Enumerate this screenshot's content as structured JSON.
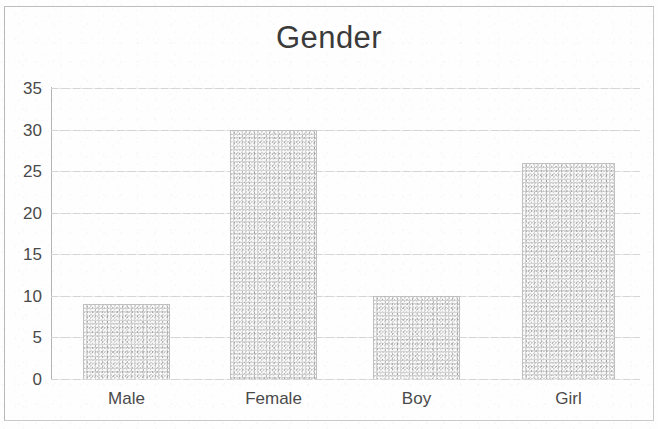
{
  "chart_data": {
    "type": "bar",
    "title": "Gender",
    "xlabel": "",
    "ylabel": "",
    "categories": [
      "Male",
      "Female",
      "Boy",
      "Girl"
    ],
    "values": [
      9,
      30,
      10,
      26
    ],
    "ylim": [
      0,
      35
    ],
    "y_ticks": [
      0,
      5,
      10,
      15,
      20,
      25,
      30,
      35
    ],
    "y_tick_labels": [
      "0",
      "5",
      "10",
      "15",
      "20",
      "25",
      "30",
      "35"
    ],
    "grid": true,
    "grid_axis": "y",
    "legend": false,
    "legend_position": "none",
    "series": [
      {
        "name": "Gender",
        "values": [
          9,
          30,
          10,
          26
        ],
        "color": "#d4d4d4"
      }
    ]
  },
  "style": {
    "bar_fill": "#d4d4d4",
    "bar_border": "#c0c0c0",
    "gridline_color": "#dcdcdc",
    "axis_color": "#b4b4b4",
    "text_color": "#4a4a4a",
    "title_color": "#3b3b3b",
    "frame_color": "#c9c9c9",
    "background": "#fefefe"
  }
}
